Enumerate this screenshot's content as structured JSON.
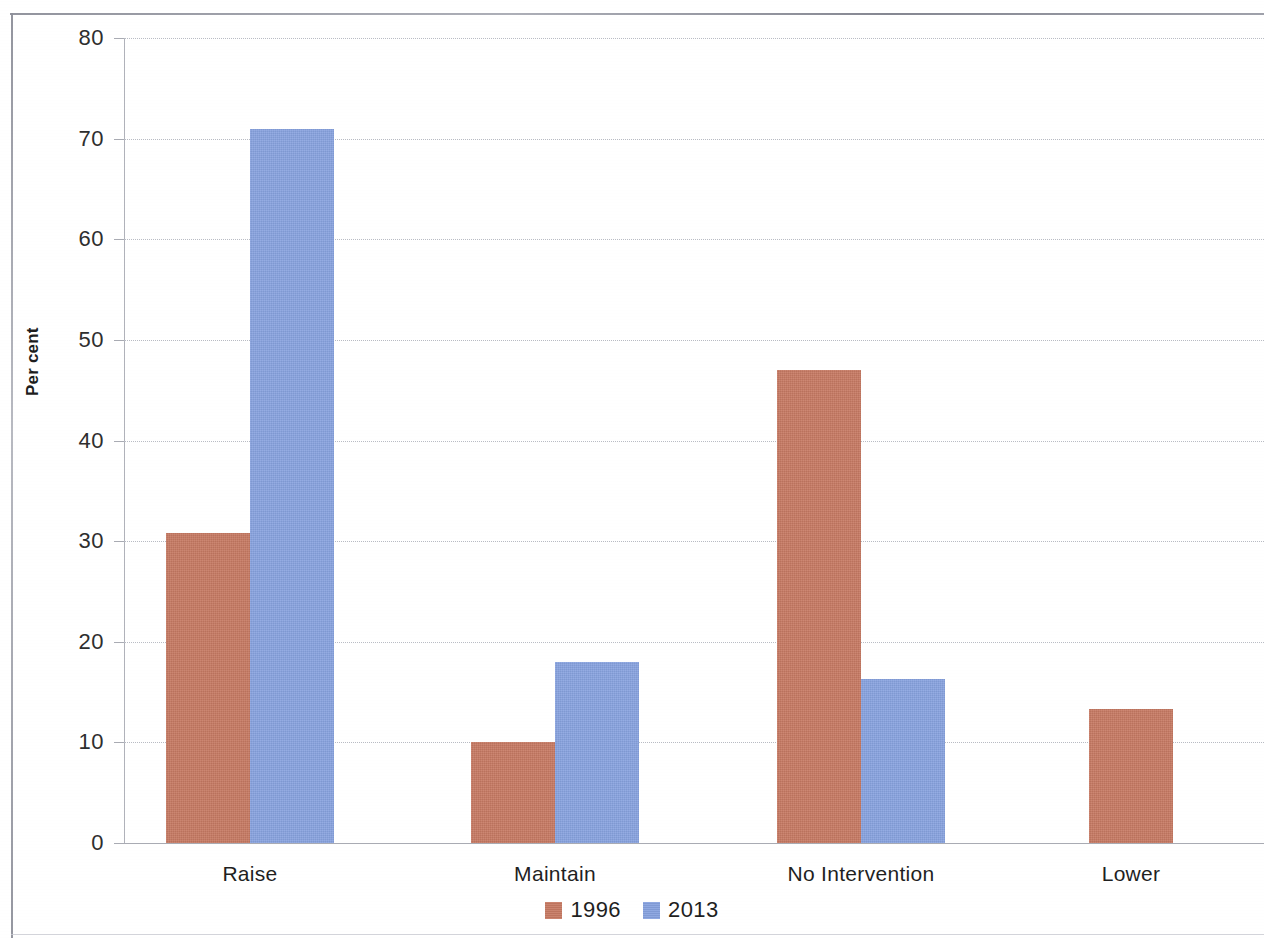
{
  "chart_data": {
    "type": "bar",
    "title": "",
    "subtitle": "",
    "xlabel": "",
    "ylabel": "Per cent",
    "categories": [
      "Raise",
      "Maintain",
      "No Intervention",
      "Lower"
    ],
    "series": [
      {
        "name": "1996",
        "color": "#c77a63",
        "values": [
          30.8,
          10.0,
          47.0,
          13.3
        ]
      },
      {
        "name": "2013",
        "color": "#87a2df",
        "values": [
          71.0,
          18.0,
          16.3,
          null
        ]
      }
    ],
    "ylim": [
      0,
      80
    ],
    "ytick_values": [
      0,
      10,
      20,
      30,
      40,
      50,
      60,
      70,
      80
    ],
    "ytick_labels": [
      "0",
      "10",
      "20",
      "30",
      "40",
      "50",
      "60",
      "70",
      "80"
    ],
    "grid": true,
    "grid_style": "dotted-horizontal",
    "legend_position": "bottom-center",
    "legend_entries": [
      "1996",
      "2013"
    ],
    "bar_layout": "grouped-adjacent"
  },
  "axes": {
    "y_label": "Per cent",
    "x_categories": [
      "Raise",
      "Maintain",
      "No Intervention",
      "Lower"
    ]
  },
  "legend": {
    "items": [
      {
        "label": "1996",
        "color": "#c77a63"
      },
      {
        "label": "2013",
        "color": "#87a2df"
      }
    ]
  },
  "colors": {
    "series_1996": "#c77a63",
    "series_2013": "#87a2df",
    "gridline": "#b9bcc4",
    "axis": "#a9abb3",
    "text": "#1f1f1f",
    "frame": "#8d8f99",
    "background": "#ffffff"
  }
}
